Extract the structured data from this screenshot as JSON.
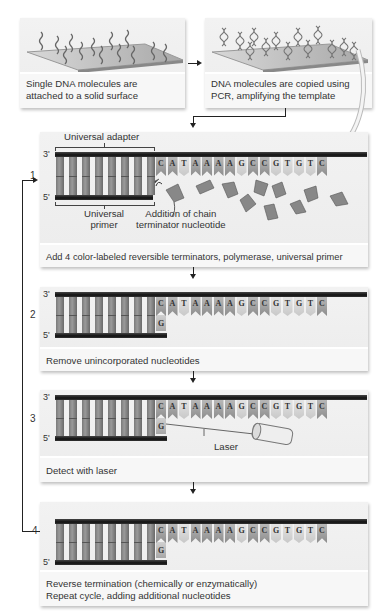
{
  "top_panels": [
    {
      "caption_line1": "Single DNA molecules are",
      "caption_line2": "attached to a solid surface"
    },
    {
      "caption_line1": "DNA molecules are copied using",
      "caption_line2": "PCR, amplifying the template"
    }
  ],
  "template_sequence": [
    "C",
    "A",
    "T",
    "A",
    "A",
    "A",
    "A",
    "G",
    "C",
    "C",
    "G",
    "T",
    "G",
    "T",
    "C"
  ],
  "incorporated_nucleotide": "G",
  "strand_labels": {
    "three_prime": "3'",
    "five_prime": "5'"
  },
  "steps": [
    {
      "number": "1",
      "caption": "Add 4 color-labeled reversible terminators, polymerase, universal primer",
      "labels": {
        "universal_adapter": "Universal adapter",
        "universal_primer_line1": "Universal",
        "universal_primer_line2": "primer",
        "addition_line1": "Addition of chain",
        "addition_line2": "terminator nucleotide"
      }
    },
    {
      "number": "2",
      "caption": "Remove unincorporated nucleotides"
    },
    {
      "number": "3",
      "caption": "Detect with laser",
      "labels": {
        "laser": "Laser"
      }
    },
    {
      "number": "4",
      "caption_line1": "Reverse termination (chemically or enzymatically)",
      "caption_line2": "Repeat cycle, adding additional nucleotides"
    }
  ],
  "colors": {
    "panel_bg": "#eeeeee",
    "caption_bg": "#f7f7f7",
    "strand": "#1a1a1a",
    "arrow": "#222222"
  }
}
